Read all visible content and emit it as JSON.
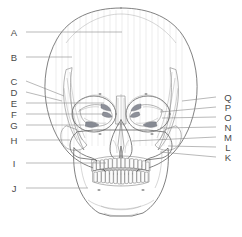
{
  "figure": {
    "view": "anterior (frontal)",
    "background_color": "#ffffff",
    "outline_color": "#575757",
    "leader_line_color": "#8a8a8a",
    "label_color": "#4a4a4a",
    "bone_fill_light": "#fbfbfb",
    "bone_fill_mid": "#eeeeee",
    "bone_fill_shadow": "#d8d8d8",
    "cavity_fill": "#ffffff"
  },
  "labels": {
    "left": [
      {
        "id": "A",
        "text": "A",
        "y": 32,
        "target_x": 122,
        "target_y": 32
      },
      {
        "id": "B",
        "text": "B",
        "y": 57,
        "target_x": 72,
        "target_y": 57
      },
      {
        "id": "C",
        "text": "C",
        "y": 81,
        "target_x": 64,
        "target_y": 96
      },
      {
        "id": "D",
        "text": "D",
        "y": 92,
        "target_x": 62,
        "target_y": 101
      },
      {
        "id": "E",
        "text": "E",
        "y": 103,
        "target_x": 104,
        "target_y": 106
      },
      {
        "id": "F",
        "text": "F",
        "y": 114,
        "target_x": 104,
        "target_y": 114
      },
      {
        "id": "G",
        "text": "G",
        "y": 125,
        "target_x": 84,
        "target_y": 128
      },
      {
        "id": "H",
        "text": "H",
        "y": 140,
        "target_x": 70,
        "target_y": 140
      },
      {
        "id": "I",
        "text": "I",
        "y": 163,
        "target_x": 106,
        "target_y": 163
      },
      {
        "id": "J",
        "text": "J",
        "y": 188,
        "target_x": 88,
        "target_y": 188
      }
    ],
    "right": [
      {
        "id": "Q",
        "text": "Q",
        "y": 97,
        "target_x": 182,
        "target_y": 101
      },
      {
        "id": "P",
        "text": "P",
        "y": 107,
        "target_x": 160,
        "target_y": 112
      },
      {
        "id": "O",
        "text": "O",
        "y": 117,
        "target_x": 162,
        "target_y": 118
      },
      {
        "id": "N",
        "text": "N",
        "y": 127,
        "target_x": 160,
        "target_y": 128
      },
      {
        "id": "M",
        "text": "M",
        "y": 137,
        "target_x": 132,
        "target_y": 141
      },
      {
        "id": "L",
        "text": "L",
        "y": 147,
        "target_x": 168,
        "target_y": 146
      },
      {
        "id": "K",
        "text": "K",
        "y": 157,
        "target_x": 160,
        "target_y": 152
      }
    ]
  },
  "geometry": {
    "left_label_x": 14,
    "right_label_x": 228,
    "left_leader_start_x": 26,
    "right_leader_start_x": 216,
    "midline_x": 121
  }
}
